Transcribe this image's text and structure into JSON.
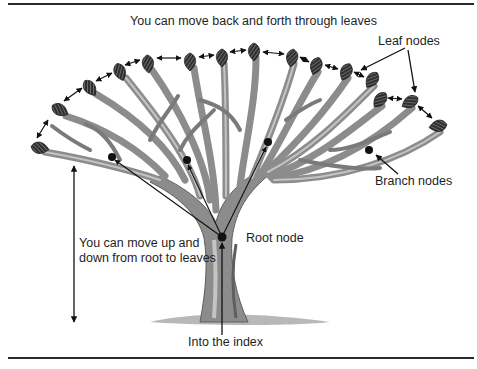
{
  "figure": {
    "title_label": "You can move back and forth through leaves",
    "leaf_label": "Leaf nodes",
    "branch_label": "Branch nodes",
    "root_label": "Root node",
    "updown_label_line1": "You can move up and",
    "updown_label_line2": "down from root to leaves",
    "entry_label": "Into the index"
  },
  "colors": {
    "trunk": "#8c8c8c",
    "trunk_dark": "#5f5f5f",
    "trunk_light": "#c4c4c4",
    "leaf": "#3a3a3a",
    "node": "#111111",
    "arrow": "#111111",
    "rule": "#2a2a2a"
  },
  "leaves": [
    {
      "x": 40,
      "y": 148
    },
    {
      "x": 60,
      "y": 110
    },
    {
      "x": 90,
      "y": 88
    },
    {
      "x": 120,
      "y": 72
    },
    {
      "x": 148,
      "y": 64
    },
    {
      "x": 190,
      "y": 62
    },
    {
      "x": 222,
      "y": 58
    },
    {
      "x": 254,
      "y": 52
    },
    {
      "x": 292,
      "y": 58
    },
    {
      "x": 316,
      "y": 66
    },
    {
      "x": 346,
      "y": 72
    },
    {
      "x": 372,
      "y": 80
    },
    {
      "x": 380,
      "y": 100
    },
    {
      "x": 410,
      "y": 102
    },
    {
      "x": 438,
      "y": 126
    }
  ],
  "nodes": {
    "root": {
      "x": 222,
      "y": 237
    },
    "branches": [
      {
        "x": 112,
        "y": 157
      },
      {
        "x": 187,
        "y": 160
      },
      {
        "x": 268,
        "y": 142
      },
      {
        "x": 369,
        "y": 150
      }
    ]
  }
}
